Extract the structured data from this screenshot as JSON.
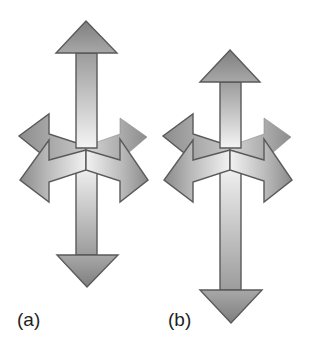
{
  "figure": {
    "panels": [
      {
        "id": "a",
        "label": "(a)",
        "vertical_arrow": {
          "up_tip_y": 21,
          "down_tip_y": 287,
          "center_x": 86
        },
        "horizontal_arrow": {
          "left_tip_x": 20,
          "right_tip_x": 148,
          "y": 180
        }
      },
      {
        "id": "b",
        "label": "(b)",
        "vertical_arrow": {
          "up_tip_y": 50,
          "down_tip_y": 323,
          "center_x": 230
        },
        "horizontal_arrow": {
          "left_tip_x": 164,
          "right_tip_x": 292,
          "y": 180
        }
      }
    ]
  },
  "colors": {
    "outline": "#5a5a5a",
    "head_dark": "#7e7e7e",
    "head_light": "#b4b4b4",
    "shaft_dark": "#9c9c9c",
    "shaft_light": "#f4f4f4",
    "label": "#1f1f1f",
    "background": "#ffffff"
  }
}
